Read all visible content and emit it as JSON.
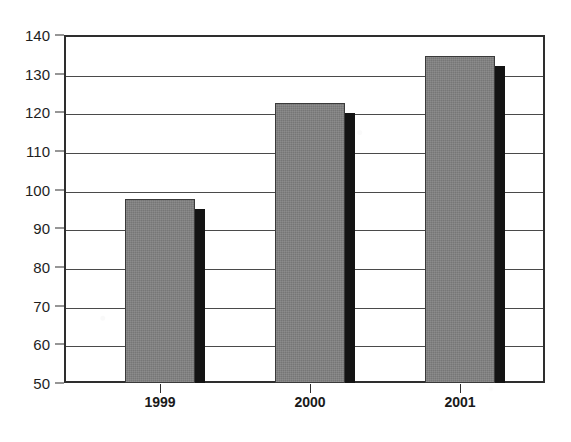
{
  "chart_data": {
    "type": "bar",
    "title": "(in millions)",
    "title_visibility": "cropped-at-top",
    "subtitle": "",
    "xlabel": "",
    "ylabel": "",
    "categories": [
      "1999",
      "2000",
      "2001"
    ],
    "values": [
      97.5,
      122.5,
      134.5
    ],
    "series": [
      {
        "name": "Annual value",
        "values": [
          97.5,
          122.5,
          134.5
        ]
      }
    ],
    "ylim": [
      50,
      140
    ],
    "y_ticks": [
      50,
      60,
      70,
      80,
      90,
      100,
      110,
      120,
      130,
      140
    ],
    "y_tick_labels": [
      "50",
      "60",
      "70",
      "80",
      "90",
      "100",
      "110",
      "120",
      "130",
      "140"
    ],
    "grid": true,
    "grid_axis": "y",
    "legend": false,
    "legend_position": "none",
    "annotations": [],
    "bar_style": {
      "fill_color": "#808080",
      "edge_color": "#3a3a3a",
      "shadow_color": "#131313",
      "shadow": true
    },
    "axis_color": "#2e2e2e",
    "background_color": "#ffffff"
  },
  "figure": {
    "frame_name": "plot-frame",
    "tick_style": "outward"
  }
}
